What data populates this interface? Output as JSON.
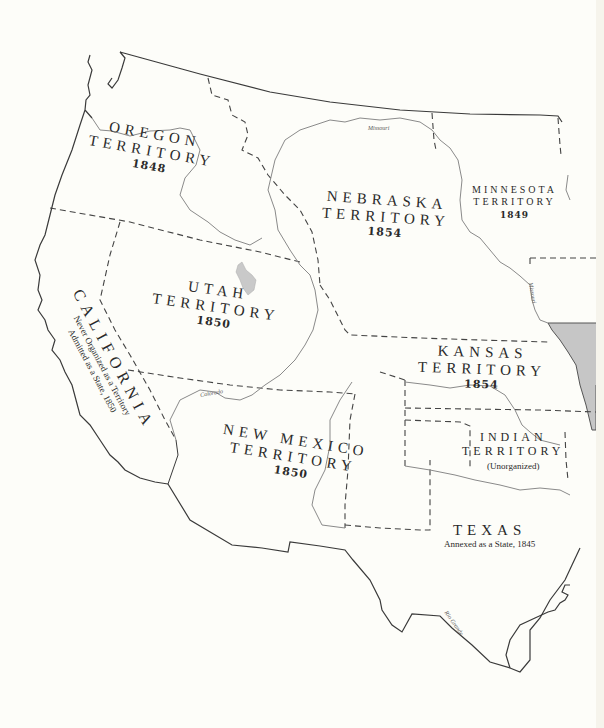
{
  "map": {
    "title": "Western Territories, 1848–1854",
    "colors": {
      "background": "#fdfdf9",
      "border": "#3a3a3a",
      "river": "#8a8a8a",
      "lake": "#c9c9c9",
      "state_fill": "#c6c6c6",
      "text": "#2a2a2a"
    },
    "regions": [
      {
        "id": "oregon",
        "name_lines": [
          "OREGON",
          "TERRITORY"
        ],
        "year": "1848"
      },
      {
        "id": "nebraska",
        "name_lines": [
          "NEBRASKA",
          "TERRITORY"
        ],
        "year": "1854"
      },
      {
        "id": "minnesota",
        "name_lines": [
          "MINNESOTA",
          "TERRITORY"
        ],
        "year": "1849"
      },
      {
        "id": "utah",
        "name_lines": [
          "UTAH",
          "TERRITORY"
        ],
        "year": "1850"
      },
      {
        "id": "california",
        "name_lines": [
          "CALIFORNIA"
        ],
        "notes": [
          "Never Organized as a Territory",
          "Admitted as a State, 1850"
        ]
      },
      {
        "id": "kansas",
        "name_lines": [
          "KANSAS",
          "TERRITORY"
        ],
        "year": "1854"
      },
      {
        "id": "indian",
        "name_lines": [
          "INDIAN",
          "TERRITORY"
        ],
        "note": "(Unorganized)"
      },
      {
        "id": "new_mexico",
        "name_lines": [
          "NEW MEXICO",
          "TERRITORY"
        ],
        "year": "1850"
      },
      {
        "id": "texas",
        "name_lines": [
          "TEXAS"
        ],
        "note": "Annexed as a State, 1845"
      }
    ],
    "rivers": [
      {
        "name": "Missouri",
        "position": "upper"
      },
      {
        "name": "Missouri",
        "position": "east"
      },
      {
        "name": "Colorado",
        "position": "southwest"
      },
      {
        "name": "Rio Grande",
        "position": "south"
      }
    ]
  }
}
